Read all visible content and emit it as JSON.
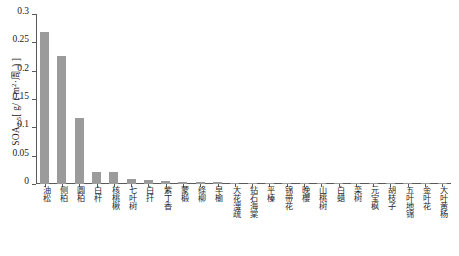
{
  "chart_data": {
    "type": "bar",
    "title": "",
    "xlabel": "",
    "ylabel": "SOA2.5 [ g/ ( m2·周 ) ]",
    "ylabel_parts": {
      "main": "SOA",
      "subscript": "2.5",
      "unit_open": "[ g/ ( m",
      "unit_sup": "2",
      "unit_close": "·周 ) ]"
    },
    "ylim": [
      0,
      0.3
    ],
    "ytick_labels": [
      "0",
      "0.05",
      "0.1",
      "0.15",
      "0.2",
      "0.25",
      "0.3"
    ],
    "ytick_values": [
      0,
      0.05,
      0.1,
      0.15,
      0.2,
      0.25,
      0.3
    ],
    "grid": false,
    "legend": "none",
    "bar_color": "#9b9b9b",
    "axis_color": "#5a5a5a",
    "categories": [
      "油松",
      "侧柏",
      "圆柏",
      "白杆",
      "核桃楸",
      "七叶树",
      "白扦",
      "紫丁香",
      "蒙椴",
      "绦柳",
      "早榆",
      "大花溲疏",
      "钻石海棠",
      "平榛",
      "锦带花",
      "晚櫻",
      "山桃树",
      "白蜡",
      "栾树",
      "元宝枫",
      "胡枝子",
      "五叶地锦",
      "金叶花",
      "大叶黄杨"
    ],
    "values": [
      0.268,
      0.226,
      0.117,
      0.021,
      0.021,
      0.008,
      0.007,
      0.005,
      0.004,
      0.004,
      0.003,
      0.002,
      0.002,
      0.001,
      0.001,
      0.001,
      0.001,
      0.001,
      0.0008,
      0.0006,
      0.0005,
      0.0004,
      0.0003,
      0.0002
    ]
  }
}
